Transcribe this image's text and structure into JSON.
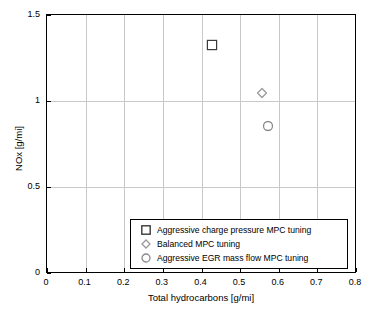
{
  "chart_data": {
    "type": "scatter",
    "title": "",
    "xlabel": "Total hydrocarbons [g/mi]",
    "ylabel": "NOx [g/mi]",
    "xlim": [
      0,
      0.8
    ],
    "ylim": [
      0,
      1.5
    ],
    "xticks": [
      "0",
      "0.1",
      "0.2",
      "0.3",
      "0.4",
      "0.5",
      "0.6",
      "0.7",
      "0.8"
    ],
    "yticks": [
      "0",
      "0.5",
      "1",
      "1.5"
    ],
    "grid": true,
    "legend_position": "bottom-center-inside",
    "series": [
      {
        "name": "Aggressive charge pressure MPC tuning",
        "marker": "square",
        "color": "#3a3a3a",
        "points": [
          {
            "x": 0.426,
            "y": 1.325
          }
        ]
      },
      {
        "name": "Balanced MPC tuning",
        "marker": "diamond",
        "color": "#9a9a9a",
        "points": [
          {
            "x": 0.556,
            "y": 1.045
          }
        ]
      },
      {
        "name": "Aggressive EGR mass flow MPC tuning",
        "marker": "circle",
        "color": "#8a8a8a",
        "points": [
          {
            "x": 0.572,
            "y": 0.855
          }
        ]
      }
    ]
  }
}
